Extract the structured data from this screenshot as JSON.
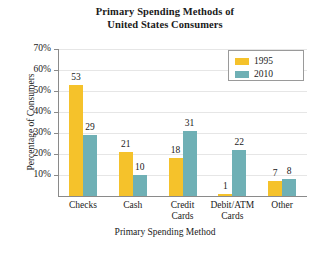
{
  "chart_data": {
    "type": "bar",
    "title": "Primary Spending Methods of United States Consumers",
    "title_lines": [
      "Primary Spending Methods of",
      "United States Consumers"
    ],
    "xlabel": "Primary Spending Method",
    "ylabel": "Percentage of Consumers",
    "categories": [
      "Checks",
      "Cash",
      "Credit Cards",
      "Debit/ATM Cards",
      "Other"
    ],
    "category_lines": [
      [
        "Checks"
      ],
      [
        "Cash"
      ],
      [
        "Credit",
        "Cards"
      ],
      [
        "Debit/ATM",
        "Cards"
      ],
      [
        "Other"
      ]
    ],
    "series": [
      {
        "name": "1995",
        "color": "#f5c22b",
        "values": [
          53,
          21,
          18,
          1,
          7
        ]
      },
      {
        "name": "2010",
        "color": "#6fb0b5",
        "values": [
          29,
          10,
          31,
          22,
          8
        ]
      }
    ],
    "ylim": [
      0,
      70
    ],
    "yticks": [
      10,
      20,
      30,
      40,
      50,
      60,
      70
    ],
    "ytick_labels": [
      "10%",
      "20%",
      "30%",
      "40%",
      "50%",
      "60%",
      "70%"
    ],
    "value_suffix": "",
    "grid": true,
    "legend_position": "top-right"
  },
  "legend": {
    "entries": [
      {
        "label": "1995",
        "color": "#f5c22b"
      },
      {
        "label": "2010",
        "color": "#6fb0b5"
      }
    ]
  }
}
